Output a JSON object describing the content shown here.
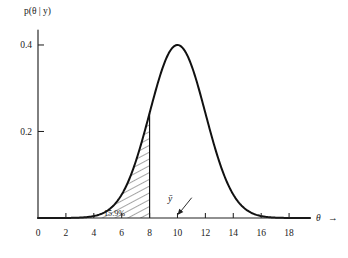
{
  "figure": {
    "background_color": "#ffffff",
    "ink_color": "#111111",
    "y_axis_label": "p(θ | y)",
    "x_axis_label": "θ",
    "x_axis_arrow": "→"
  },
  "annotations": {
    "shaded_area_label": "15.9%",
    "mean_marker_label": "ȳ",
    "mean_marker_value": 10
  },
  "axis": {
    "x_ticks": [
      "0",
      "2",
      "4",
      "6",
      "8",
      "10",
      "12",
      "14",
      "16",
      "18"
    ],
    "x_tick_values": [
      0,
      2,
      4,
      6,
      8,
      10,
      12,
      14,
      16,
      18
    ],
    "y_ticks": [
      "0.2",
      "0.4"
    ],
    "y_tick_values": [
      0.2,
      0.4
    ]
  },
  "chart_data": {
    "type": "line",
    "title": "",
    "subtitle": "",
    "xlabel": "θ",
    "ylabel": "p(θ | y)",
    "xlim": [
      0,
      19.5
    ],
    "ylim": [
      0,
      0.43
    ],
    "grid": false,
    "legend": false,
    "legend_position": "none",
    "distribution": {
      "family": "normal",
      "mean": 10,
      "sd": 2,
      "peak_height": 0.4,
      "note": "posterior density of theta given y, peak normalised to 0.4 at theta = 10"
    },
    "x": [
      0.0,
      0.5,
      1.0,
      1.5,
      2.0,
      2.5,
      3.0,
      3.5,
      4.0,
      4.5,
      5.0,
      5.5,
      6.0,
      6.5,
      7.0,
      7.5,
      8.0,
      8.5,
      9.0,
      9.5,
      10.0,
      10.5,
      11.0,
      11.5,
      12.0,
      12.5,
      13.0,
      13.5,
      14.0,
      14.5,
      15.0,
      15.5,
      16.0,
      16.5,
      17.0,
      17.5,
      18.0,
      18.5,
      19.0
    ],
    "y": [
      0.0,
      0.0,
      0.0001,
      0.0002,
      0.0005,
      0.0013,
      0.0033,
      0.0073,
      0.0146,
      0.0266,
      0.0439,
      0.0656,
      0.0891,
      0.1096,
      0.1225,
      0.1245,
      0.1151,
      0.0968,
      0.0742,
      0.0517,
      0.4,
      0.0517,
      0.0742,
      0.0968,
      0.1151,
      0.1245,
      0.1225,
      0.1096,
      0.0891,
      0.0656,
      0.0439,
      0.0266,
      0.0146,
      0.0073,
      0.0033,
      0.0013,
      0.0005,
      0.0002,
      0.0001
    ],
    "curve_samples": [
      {
        "theta": 2.0,
        "density": 0.0003
      },
      {
        "theta": 3.0,
        "density": 0.0022
      },
      {
        "theta": 4.0,
        "density": 0.0108
      },
      {
        "theta": 5.0,
        "density": 0.0359
      },
      {
        "theta": 6.0,
        "density": 0.0811
      },
      {
        "theta": 7.0,
        "density": 0.1247
      },
      {
        "theta": 8.0,
        "density": 0.2427
      },
      {
        "theta": 9.0,
        "density": 0.3526
      },
      {
        "theta": 10.0,
        "density": 0.4
      },
      {
        "theta": 11.0,
        "density": 0.3526
      },
      {
        "theta": 12.0,
        "density": 0.2427
      },
      {
        "theta": 13.0,
        "density": 0.1247
      },
      {
        "theta": 14.0,
        "density": 0.0811
      },
      {
        "theta": 15.0,
        "density": 0.0359
      },
      {
        "theta": 16.0,
        "density": 0.0108
      },
      {
        "theta": 17.0,
        "density": 0.0022
      },
      {
        "theta": 18.0,
        "density": 0.0003
      }
    ],
    "shaded_region": {
      "from": 0,
      "to": 8,
      "label": "15.9%",
      "probability": 0.159,
      "style": "diagonal-hatch"
    },
    "markers": [
      {
        "label": "ȳ",
        "x": 10,
        "y": 0,
        "style": "arrow-pointing-down-left"
      }
    ]
  }
}
